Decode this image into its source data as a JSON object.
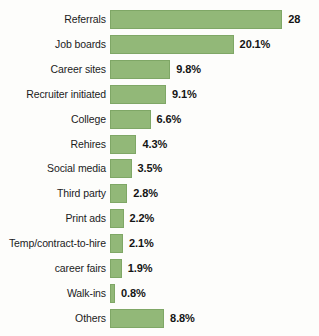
{
  "chart_data": {
    "type": "bar",
    "orientation": "horizontal",
    "title": "",
    "subtitle": "",
    "xlabel": "",
    "ylabel": "",
    "grid": false,
    "legend": null,
    "axis_visible": false,
    "xlim": [
      0,
      28
    ],
    "categories": [
      "Referrals",
      "Job boards",
      "Career sites",
      "Recruiter initiated",
      "College",
      "Rehires",
      "Social media",
      "Third party",
      "Print ads",
      "Temp/contract-to-hire",
      "career fairs",
      "Walk-ins",
      "Others"
    ],
    "values": [
      28,
      20.1,
      9.8,
      9.1,
      6.6,
      4.3,
      3.5,
      2.8,
      2.2,
      2.1,
      1.9,
      0.8,
      8.8
    ],
    "data_labels": [
      "28",
      "20.1%",
      "9.8%",
      "9.1%",
      "6.6%",
      "4.3%",
      "3.5%",
      "2.8%",
      "2.2%",
      "2.1%",
      "1.9%",
      "0.8%",
      "8.8%"
    ],
    "colors": {
      "bar_fill": "#92b878",
      "bar_stroke": "#7fa766",
      "label_text": "#1b1b1b",
      "value_text": "#141414",
      "background": "#fdfdfb"
    }
  }
}
